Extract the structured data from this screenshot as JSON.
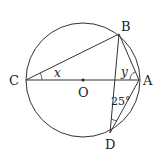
{
  "diagram": {
    "type": "circle-geometry",
    "circle": {
      "center_label": "O",
      "cx": 83,
      "cy": 80,
      "r": 57
    },
    "points": {
      "A": {
        "label": "A",
        "x": 139,
        "y": 80
      },
      "B": {
        "label": "B",
        "x": 119,
        "y": 34
      },
      "C": {
        "label": "C",
        "x": 26,
        "y": 80
      },
      "D": {
        "label": "D",
        "x": 110,
        "y": 133
      },
      "O": {
        "label": "O",
        "x": 83,
        "y": 80
      }
    },
    "segments": [
      "CA",
      "CB",
      "BA",
      "BD",
      "DA"
    ],
    "angles": {
      "x": {
        "label": "x",
        "at": "C",
        "between": "BCA"
      },
      "y": {
        "label": "y",
        "at": "A",
        "between": "BAC"
      },
      "given": {
        "label": "25°",
        "at": "D",
        "between": "BDA"
      }
    },
    "colors": {
      "stroke": "#333333",
      "text": "#222222",
      "background": "#ffffff"
    }
  }
}
